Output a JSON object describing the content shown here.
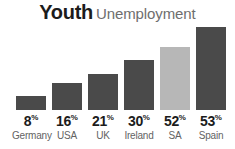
{
  "title": {
    "main": "Youth",
    "sub": "Unemployment"
  },
  "chart_data": {
    "type": "bar",
    "xlabel": "",
    "ylabel": "",
    "unit": "%",
    "ylim": [
      0,
      60
    ],
    "grid": false,
    "legend": "none",
    "categories": [
      "Germany",
      "USA",
      "UK",
      "Ireland",
      "SA",
      "Spain"
    ],
    "values": [
      8,
      16,
      21,
      30,
      52,
      53
    ],
    "value_labels": [
      "8%",
      "16%",
      "21%",
      "30%",
      "52%",
      "53%"
    ],
    "bar_colors": [
      "#4a4a4a",
      "#4a4a4a",
      "#4a4a4a",
      "#4a4a4a",
      "#b7b7b7",
      "#4a4a4a"
    ],
    "highlight_category": "SA",
    "highlight_color": "#b7b7b7",
    "default_color": "#4a4a4a"
  },
  "bars": [
    {
      "country": "Germany",
      "pct_num": "8",
      "pct_sym": "%",
      "value": 8,
      "color": "#4a4a4a",
      "x": 16,
      "height": 14
    },
    {
      "country": "USA",
      "pct_num": "16",
      "pct_sym": "%",
      "value": 16,
      "color": "#4a4a4a",
      "x": 52,
      "height": 27
    },
    {
      "country": "UK",
      "pct_num": "21",
      "pct_sym": "%",
      "value": 21,
      "color": "#4a4a4a",
      "x": 88,
      "height": 36
    },
    {
      "country": "Ireland",
      "pct_num": "30",
      "pct_sym": "%",
      "value": 30,
      "color": "#4a4a4a",
      "x": 124,
      "height": 50
    },
    {
      "country": "SA",
      "pct_num": "52",
      "pct_sym": "%",
      "value": 52,
      "color": "#b7b7b7",
      "x": 160,
      "height": 63
    },
    {
      "country": "Spain",
      "pct_num": "53",
      "pct_sym": "%",
      "value": 53,
      "color": "#4a4a4a",
      "x": 196,
      "height": 83
    }
  ],
  "colors": {
    "background": "#ffffff",
    "title_main": "#1c1c1c",
    "title_sub": "#6e6e6e",
    "value_text": "#1c1c1c",
    "category_text": "#636363"
  }
}
